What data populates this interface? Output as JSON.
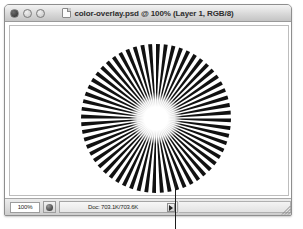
{
  "window": {
    "title": "color-overlay.psd @ 100% (Layer 1, RGB/8)",
    "controls": {
      "close_label": "",
      "minimize_label": "",
      "zoom_label": ""
    }
  },
  "statusbar": {
    "zoom_level": "100%",
    "doc_size": "Doc: 703.1K/703.6K",
    "popup_arrow_label": ""
  },
  "canvas": {
    "artwork_name": "radial starburst"
  },
  "colors": {
    "ray": "#111111",
    "background": "#ffffff",
    "window_chrome": "#d8d8d8",
    "leader_line": "#1d1d1d"
  },
  "chart_data": {
    "type": "pie",
    "xlabel": "",
    "ylabel": "",
    "ray_count": 60,
    "spoke_angle_deg": 3,
    "center_x": 150,
    "center_y": 113,
    "outer_radius": 75,
    "core_radius": 13,
    "categories": [
      "black ray",
      "white gap"
    ],
    "values": [
      50,
      50
    ],
    "legend_position": "none",
    "grid": false
  }
}
